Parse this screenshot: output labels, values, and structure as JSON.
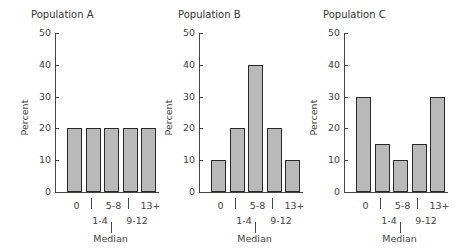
{
  "chart_data": [
    {
      "type": "bar",
      "title": "Population A",
      "categories": [
        "0",
        "1-4",
        "5-8",
        "9-12",
        "13+"
      ],
      "values": [
        20,
        20,
        20,
        20,
        20
      ],
      "xlabel": "Median",
      "ylabel": "Percent",
      "ylim": [
        0,
        50
      ],
      "yticks": [
        0,
        10,
        20,
        30,
        40,
        50
      ],
      "grid": false
    },
    {
      "type": "bar",
      "title": "Population B",
      "categories": [
        "0",
        "1-4",
        "5-8",
        "9-12",
        "13+"
      ],
      "values": [
        10,
        20,
        40,
        20,
        10
      ],
      "xlabel": "Median",
      "ylabel": "Percent",
      "ylim": [
        0,
        50
      ],
      "yticks": [
        0,
        10,
        20,
        30,
        40,
        50
      ],
      "grid": false
    },
    {
      "type": "bar",
      "title": "Population C",
      "categories": [
        "0",
        "1-4",
        "5-8",
        "9-12",
        "13+"
      ],
      "values": [
        30,
        15,
        10,
        15,
        30
      ],
      "xlabel": "Median",
      "ylabel": "Percent",
      "ylim": [
        0,
        50
      ],
      "yticks": [
        0,
        10,
        20,
        30,
        40,
        50
      ],
      "grid": false
    }
  ],
  "charts": [
    {
      "title": "Population A",
      "ylabel": "Percent",
      "xlabel": "Median",
      "ticks": [
        "0",
        "10",
        "20",
        "30",
        "40",
        "50"
      ],
      "cats": [
        "0",
        "1-4",
        "5-8",
        "9-12",
        "13+"
      ]
    },
    {
      "title": "Population B",
      "ylabel": "Percent",
      "xlabel": "Median",
      "ticks": [
        "0",
        "10",
        "20",
        "30",
        "40",
        "50"
      ],
      "cats": [
        "0",
        "1-4",
        "5-8",
        "9-12",
        "13+"
      ]
    },
    {
      "title": "Population C",
      "ylabel": "Percent",
      "xlabel": "Median",
      "ticks": [
        "0",
        "10",
        "20",
        "30",
        "40",
        "50"
      ],
      "cats": [
        "0",
        "1-4",
        "5-8",
        "9-12",
        "13+"
      ]
    }
  ],
  "colors": {
    "bar_fill": "#b9b9b9",
    "bar_stroke": "#2a2a2a",
    "axis": "#444444"
  }
}
